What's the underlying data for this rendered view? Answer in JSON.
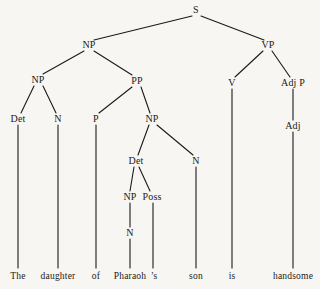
{
  "figure": {
    "kind": "syntax-tree",
    "sentence": "The daughter of Pharaoh 's son is handsome",
    "background_color": "#f7f6f2",
    "ink_color": "#1a1a1a",
    "width": 320,
    "height": 289
  },
  "nodes": [
    {
      "id": "S",
      "label": "S",
      "x": 196,
      "y": 10
    },
    {
      "id": "NP1",
      "label": "NP",
      "x": 89,
      "y": 45
    },
    {
      "id": "VP",
      "label": "VP",
      "x": 268,
      "y": 45
    },
    {
      "id": "NP2",
      "label": "NP",
      "x": 38,
      "y": 80
    },
    {
      "id": "PP",
      "label": "PP",
      "x": 137,
      "y": 81
    },
    {
      "id": "V",
      "label": "V",
      "x": 232,
      "y": 83
    },
    {
      "id": "AdjP",
      "label": "Adj P",
      "x": 293,
      "y": 83
    },
    {
      "id": "Det1",
      "label": "Det",
      "x": 18,
      "y": 119
    },
    {
      "id": "N1",
      "label": "N",
      "x": 58,
      "y": 119
    },
    {
      "id": "P",
      "label": "P",
      "x": 96,
      "y": 119
    },
    {
      "id": "NP3",
      "label": "NP",
      "x": 152,
      "y": 119
    },
    {
      "id": "Adj",
      "label": "Adj",
      "x": 293,
      "y": 126
    },
    {
      "id": "Det2",
      "label": "Det",
      "x": 136,
      "y": 161
    },
    {
      "id": "N2",
      "label": "N",
      "x": 196,
      "y": 161
    },
    {
      "id": "NP4",
      "label": "NP",
      "x": 130,
      "y": 197
    },
    {
      "id": "Poss",
      "label": "Poss",
      "x": 152,
      "y": 197
    },
    {
      "id": "N3",
      "label": "N",
      "x": 130,
      "y": 233
    }
  ],
  "edges": [
    {
      "from": "S",
      "to": "NP1",
      "x1": 192,
      "y1": 16,
      "x2": 94,
      "y2": 40
    },
    {
      "from": "S",
      "to": "VP",
      "x1": 201,
      "y1": 16,
      "x2": 264,
      "y2": 40
    },
    {
      "from": "NP1",
      "to": "NP2",
      "x1": 84,
      "y1": 51,
      "x2": 43,
      "y2": 74
    },
    {
      "from": "NP1",
      "to": "PP",
      "x1": 94,
      "y1": 51,
      "x2": 132,
      "y2": 75
    },
    {
      "from": "VP",
      "to": "V",
      "x1": 263,
      "y1": 51,
      "x2": 235,
      "y2": 77
    },
    {
      "from": "VP",
      "to": "AdjP",
      "x1": 272,
      "y1": 51,
      "x2": 290,
      "y2": 77
    },
    {
      "from": "NP2",
      "to": "Det1",
      "x1": 34,
      "y1": 86,
      "x2": 21,
      "y2": 113
    },
    {
      "from": "NP2",
      "to": "N1",
      "x1": 43,
      "y1": 86,
      "x2": 56,
      "y2": 113
    },
    {
      "from": "PP",
      "to": "P",
      "x1": 132,
      "y1": 87,
      "x2": 99,
      "y2": 113
    },
    {
      "from": "PP",
      "to": "NP3",
      "x1": 141,
      "y1": 87,
      "x2": 150,
      "y2": 113
    },
    {
      "from": "AdjP",
      "to": "Adj",
      "x1": 293,
      "y1": 89,
      "x2": 293,
      "y2": 120
    },
    {
      "from": "NP3",
      "to": "Det2",
      "x1": 149,
      "y1": 125,
      "x2": 138,
      "y2": 155
    },
    {
      "from": "NP3",
      "to": "N2",
      "x1": 157,
      "y1": 125,
      "x2": 193,
      "y2": 155
    },
    {
      "from": "Det2",
      "to": "NP4",
      "x1": 134,
      "y1": 167,
      "x2": 130,
      "y2": 191
    },
    {
      "from": "Det2",
      "to": "Poss",
      "x1": 139,
      "y1": 167,
      "x2": 150,
      "y2": 191
    },
    {
      "from": "NP4",
      "to": "N3",
      "x1": 130,
      "y1": 203,
      "x2": 130,
      "y2": 227
    }
  ],
  "leaf_lines": [
    {
      "word": "The",
      "x1": 18,
      "y1": 125,
      "x2": 18,
      "y2": 268
    },
    {
      "word": "daughter",
      "x1": 58,
      "y1": 125,
      "x2": 58,
      "y2": 268
    },
    {
      "word": "of",
      "x1": 96,
      "y1": 125,
      "x2": 96,
      "y2": 268
    },
    {
      "word": "Pharaoh",
      "x1": 130,
      "y1": 239,
      "x2": 130,
      "y2": 268
    },
    {
      "word": "'s",
      "x1": 153,
      "y1": 203,
      "x2": 153,
      "y2": 268
    },
    {
      "word": "son",
      "x1": 196,
      "y1": 167,
      "x2": 196,
      "y2": 268
    },
    {
      "word": "is",
      "x1": 232,
      "y1": 89,
      "x2": 232,
      "y2": 268
    },
    {
      "word": "handsome",
      "x1": 293,
      "y1": 132,
      "x2": 293,
      "y2": 268
    }
  ],
  "leaves": [
    {
      "id": "w1",
      "label": "The",
      "x": 18,
      "y": 277
    },
    {
      "id": "w2",
      "label": "daughter",
      "x": 58,
      "y": 277
    },
    {
      "id": "w3",
      "label": "of",
      "x": 96,
      "y": 277
    },
    {
      "id": "w4",
      "label": "Pharaoh",
      "x": 130,
      "y": 277
    },
    {
      "id": "w5",
      "label": "’s",
      "x": 154,
      "y": 277
    },
    {
      "id": "w6",
      "label": "son",
      "x": 196,
      "y": 277
    },
    {
      "id": "w7",
      "label": "is",
      "x": 232,
      "y": 277
    },
    {
      "id": "w8",
      "label": "handsome",
      "x": 293,
      "y": 277
    }
  ]
}
